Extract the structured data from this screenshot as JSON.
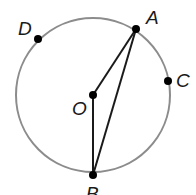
{
  "diagram": {
    "type": "circle-geometry",
    "circle": {
      "center": [
        93,
        95
      ],
      "radius": 77,
      "stroke": "#8c8c8c"
    },
    "points": [
      {
        "id": "A",
        "label": "A",
        "x": 136,
        "y": 29,
        "lx": 146,
        "ly": 24
      },
      {
        "id": "C",
        "label": "C",
        "x": 168,
        "y": 81,
        "lx": 176,
        "ly": 87
      },
      {
        "id": "D",
        "label": "D",
        "x": 38,
        "y": 39,
        "lx": 18,
        "ly": 35
      },
      {
        "id": "O",
        "label": "O",
        "x": 93,
        "y": 95,
        "lx": 72,
        "ly": 115
      },
      {
        "id": "B",
        "label": "B",
        "x": 93,
        "y": 175,
        "lx": 86,
        "ly": 200
      }
    ],
    "segments": [
      {
        "from": "O",
        "to": "A"
      },
      {
        "from": "O",
        "to": "B"
      },
      {
        "from": "A",
        "to": "B"
      }
    ],
    "line_color": "#1a1a1a",
    "point_color": "#000000"
  }
}
